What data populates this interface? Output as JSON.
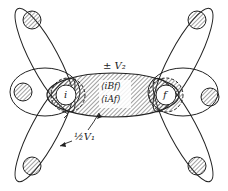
{
  "diagram": {
    "labels": {
      "v2": "± V₂",
      "v1": "½V₁",
      "bracket_b": "⟨iBf⟩",
      "bracket_a": "⟨iAf⟩",
      "node_i": "i",
      "node_f": "f"
    },
    "colors": {
      "stroke": "#222222",
      "hatch": "#444444",
      "background": "#ffffff"
    }
  }
}
